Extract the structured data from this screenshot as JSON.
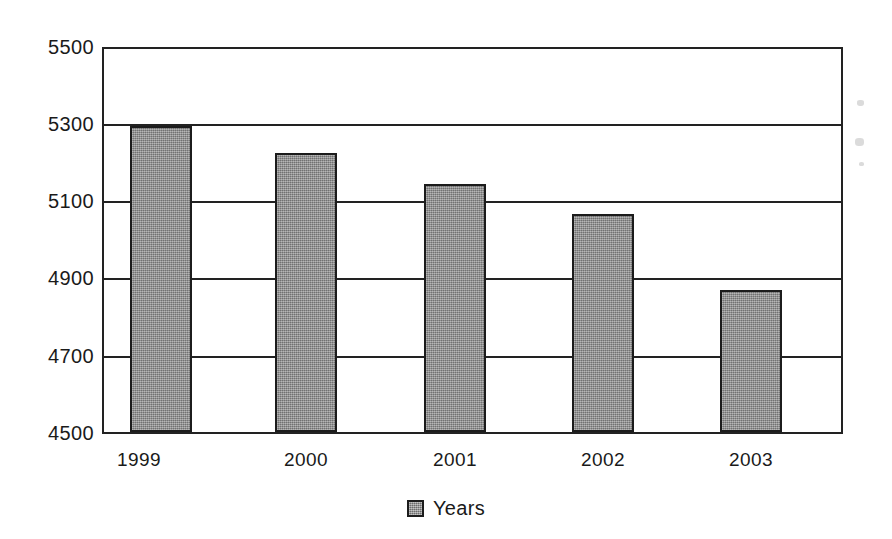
{
  "chart_data": {
    "type": "bar",
    "title": "",
    "xlabel": "",
    "ylabel": "",
    "categories": [
      "1999",
      "2000",
      "2001",
      "2002",
      "2003"
    ],
    "values": [
      5300,
      5228,
      5148,
      5070,
      4872
    ],
    "series": [
      {
        "name": "Years",
        "values": [
          5300,
          5228,
          5148,
          5070,
          4872
        ]
      }
    ],
    "ylim": [
      4500,
      5500
    ],
    "ytick_labels": [
      "5500",
      "5300",
      "5100",
      "4900",
      "4700",
      "4500"
    ],
    "ytick_values": [
      5500,
      5300,
      5100,
      4900,
      4700,
      4500
    ],
    "grid": true,
    "legend": {
      "position": "bottom-center",
      "entries": [
        {
          "label": "Years",
          "color": "#8c8c8c"
        }
      ]
    },
    "colors": {
      "bar_fill": "#8c8c8c",
      "bar_stroke": "#1c1c1c",
      "axis": "#222222",
      "text": "#1a1a1a",
      "background": "#ffffff"
    }
  }
}
